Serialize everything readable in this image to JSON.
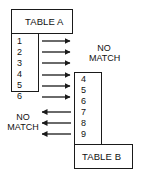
{
  "diagram": {
    "type": "table-match-diagram",
    "table_a": {
      "title": "TABLE A",
      "rows": [
        "1",
        "2",
        "3",
        "4",
        "5",
        "6"
      ]
    },
    "table_b": {
      "title": "TABLE B",
      "rows": [
        "4",
        "5",
        "6",
        "7",
        "8",
        "9"
      ]
    },
    "labels": {
      "no_match_right_line1": "NO",
      "no_match_right_line2": "MATCH",
      "no_match_left_line1": "NO",
      "no_match_left_line2": "MATCH"
    },
    "arrows": {
      "right_pointing_count": 6,
      "left_pointing_count": 3
    },
    "colors": {
      "stroke": "#1a1a1a",
      "background": "#ffffff"
    }
  }
}
